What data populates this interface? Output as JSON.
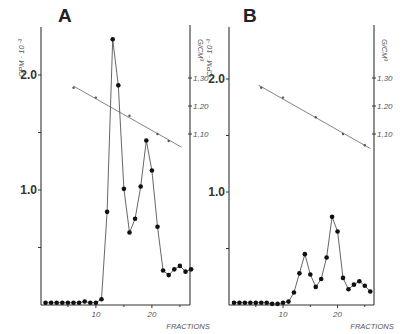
{
  "chart_data": [
    {
      "type": "line",
      "panel": "A",
      "title": "A",
      "xlabel": "FRACTIONS",
      "ylabel_left": "CPM · 10⁻³",
      "ylabel_right": "G/CM³",
      "x_ticks": [
        10,
        20
      ],
      "y_left_ticks": [
        {
          "value": 0.5,
          "label": ""
        },
        {
          "value": 1.0,
          "label": "1.0"
        },
        {
          "value": 1.5,
          "label": ""
        },
        {
          "value": 2.0,
          "label": "2.0"
        }
      ],
      "y_right_ticks": [
        {
          "value": 1.1,
          "label": "1.10"
        },
        {
          "value": 1.2,
          "label": "1.20"
        },
        {
          "value": 1.3,
          "label": "1.30"
        }
      ],
      "ylim_left": [
        0,
        2.45
      ],
      "xlim": [
        0,
        27
      ],
      "series": [
        {
          "name": "CPM",
          "x": [
            1,
            2,
            3,
            4,
            5,
            6,
            7,
            8,
            9,
            10,
            11,
            12,
            13,
            14,
            15,
            16,
            17,
            18,
            19,
            20,
            21,
            22,
            23,
            24,
            25,
            26,
            27
          ],
          "values": [
            0.02,
            0.02,
            0.02,
            0.02,
            0.02,
            0.02,
            0.02,
            0.03,
            0.02,
            0.02,
            0.05,
            0.81,
            2.31,
            1.91,
            1.01,
            0.63,
            0.75,
            1.03,
            1.43,
            1.17,
            0.68,
            0.3,
            0.26,
            0.31,
            0.34,
            0.29,
            0.31
          ]
        },
        {
          "name": "Density",
          "x": [
            6,
            10,
            16,
            21,
            23
          ],
          "values": [
            1.265,
            1.23,
            1.165,
            1.1,
            1.075
          ],
          "line_x_range": [
            6,
            25.3
          ]
        }
      ]
    },
    {
      "type": "line",
      "panel": "B",
      "title": "B",
      "xlabel": "FRACTIONS",
      "ylabel_left": "CPM · 10⁻³",
      "ylabel_right": "G/CM³",
      "x_ticks": [
        10,
        20
      ],
      "y_left_ticks": [
        {
          "value": 0.5,
          "label": ""
        },
        {
          "value": 1.0,
          "label": "1.0"
        },
        {
          "value": 1.5,
          "label": ""
        },
        {
          "value": 2.0,
          "label": "2.0"
        }
      ],
      "y_right_ticks": [
        {
          "value": 1.1,
          "label": "1.10"
        },
        {
          "value": 1.2,
          "label": "1.20"
        },
        {
          "value": 1.3,
          "label": "1.30"
        }
      ],
      "ylim_left": [
        0,
        2.45
      ],
      "xlim": [
        0,
        26
      ],
      "series": [
        {
          "name": "CPM",
          "x": [
            1,
            2,
            3,
            4,
            5,
            6,
            7,
            8,
            9,
            10,
            11,
            12,
            13,
            14,
            15,
            16,
            17,
            18,
            19,
            20,
            21,
            22,
            23,
            24,
            25,
            26
          ],
          "values": [
            0.02,
            0.02,
            0.02,
            0.02,
            0.02,
            0.02,
            0.02,
            0.01,
            0.01,
            0.02,
            0.03,
            0.11,
            0.28,
            0.45,
            0.27,
            0.16,
            0.23,
            0.42,
            0.78,
            0.65,
            0.24,
            0.14,
            0.18,
            0.21,
            0.17,
            0.12
          ]
        },
        {
          "name": "Density",
          "x": [
            6,
            10,
            16,
            21,
            25
          ],
          "values": [
            1.265,
            1.23,
            1.16,
            1.1,
            1.06
          ],
          "line_x_range": [
            5.5,
            26
          ]
        }
      ]
    }
  ]
}
